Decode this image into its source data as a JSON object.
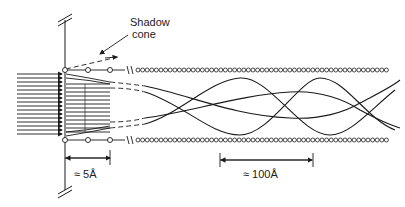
{
  "diagram": {
    "labels": {
      "shadow_cone_line1": "Shadow",
      "shadow_cone_line2": "cone",
      "short_distance": "≈ 5Å",
      "long_distance": "≈ 100Å"
    },
    "colors": {
      "ink": "#1a1a1a",
      "background": "#ffffff"
    },
    "geometry": {
      "surface_x": 65,
      "top_row_y": 70,
      "bottom_row_y": 140,
      "incident_arrow_count": 16
    }
  }
}
